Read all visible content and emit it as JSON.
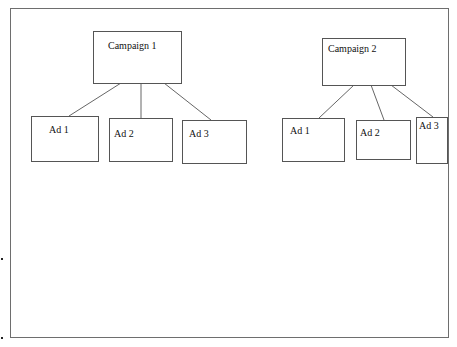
{
  "diagram": {
    "type": "hierarchy",
    "campaigns": [
      {
        "label": "Campaign 1",
        "ads": [
          {
            "label": "Ad 1"
          },
          {
            "label": "Ad 2"
          },
          {
            "label": "Ad 3"
          }
        ]
      },
      {
        "label": "Campaign 2",
        "ads": [
          {
            "label": "Ad 1"
          },
          {
            "label": "Ad 2"
          },
          {
            "label": "Ad 3"
          }
        ]
      }
    ]
  },
  "colors": {
    "border": "#555555",
    "frame": "#6e6e6e",
    "background": "#ffffff"
  }
}
